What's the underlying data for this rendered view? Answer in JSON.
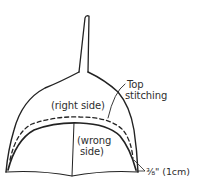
{
  "diagram": {
    "labels": {
      "right_side": "(right side)",
      "wrong_side_line1": "(wrong",
      "wrong_side_line2": "side)",
      "top_stitching_line1": "Top",
      "top_stitching_line2": "stitching",
      "seam_allowance": "⅜\" (1cm)"
    },
    "colors": {
      "stroke": "#222222",
      "background": "#ffffff",
      "text": "#2e2e2e"
    }
  }
}
